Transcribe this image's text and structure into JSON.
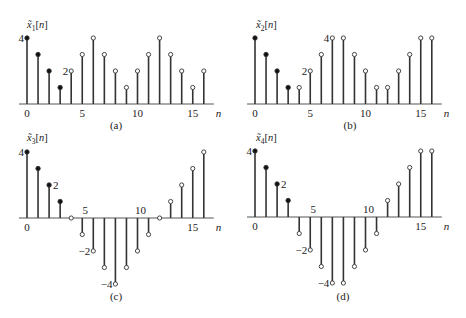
{
  "chart_data": [
    {
      "type": "stem",
      "panel_label": "(a)",
      "ylabel": "x̃1[n]",
      "ylabel_base": "x̃",
      "ylabel_sub": "1",
      "xlabel": "n",
      "x": [
        0,
        1,
        2,
        3,
        4,
        5,
        6,
        7,
        8,
        9,
        10,
        11,
        12,
        13,
        14,
        15,
        16
      ],
      "values": [
        4,
        3,
        2,
        1,
        2,
        3,
        4,
        3,
        2,
        1,
        2,
        3,
        4,
        3,
        2,
        1,
        2
      ],
      "filled": [
        true,
        true,
        true,
        true,
        false,
        false,
        false,
        false,
        false,
        false,
        false,
        false,
        false,
        false,
        false,
        false,
        false
      ],
      "x_ticks": [
        0,
        5,
        10,
        15
      ],
      "y_annotations": [
        {
          "value": 4,
          "label": "4",
          "at_n": 0
        },
        {
          "value": 2,
          "label": "2",
          "at_n": 4
        }
      ],
      "ylim": [
        0,
        4
      ]
    },
    {
      "type": "stem",
      "panel_label": "(b)",
      "ylabel": "x̃2[n]",
      "ylabel_base": "x̃",
      "ylabel_sub": "2",
      "xlabel": "n",
      "x": [
        0,
        1,
        2,
        3,
        4,
        5,
        6,
        7,
        8,
        9,
        10,
        11,
        12,
        13,
        14,
        15,
        16
      ],
      "values": [
        4,
        3,
        2,
        1,
        1,
        2,
        3,
        4,
        4,
        3,
        2,
        1,
        1,
        2,
        3,
        4,
        4
      ],
      "filled": [
        true,
        true,
        true,
        true,
        false,
        false,
        false,
        false,
        false,
        false,
        false,
        false,
        false,
        false,
        false,
        false,
        false
      ],
      "x_ticks": [
        0,
        5,
        10,
        15
      ],
      "y_annotations": [
        {
          "value": 4,
          "label": "4",
          "at_n": 7
        },
        {
          "value": 2,
          "label": "2",
          "at_n": 5
        }
      ],
      "ylim": [
        0,
        4
      ]
    },
    {
      "type": "stem",
      "panel_label": "(c)",
      "ylabel": "x̃3[n]",
      "ylabel_base": "x̃",
      "ylabel_sub": "3",
      "xlabel": "n",
      "x": [
        0,
        1,
        2,
        3,
        4,
        5,
        6,
        7,
        8,
        9,
        10,
        11,
        12,
        13,
        14,
        15,
        16
      ],
      "values": [
        4,
        3,
        2,
        1,
        0,
        -1,
        -2,
        -3,
        -4,
        -3,
        -2,
        -1,
        0,
        1,
        2,
        3,
        4
      ],
      "filled": [
        true,
        true,
        true,
        true,
        false,
        false,
        false,
        false,
        false,
        false,
        false,
        false,
        false,
        false,
        false,
        false,
        false
      ],
      "x_ticks": [
        0,
        5,
        10,
        15
      ],
      "y_annotations": [
        {
          "value": 4,
          "label": "4",
          "at_n": 0
        },
        {
          "value": 2,
          "label": "2",
          "at_n": 2,
          "side": "right"
        },
        {
          "value": -2,
          "label": "−2",
          "at_n": 6
        },
        {
          "value": -4,
          "label": "−4",
          "at_n": 8
        }
      ],
      "ylim": [
        -4,
        4
      ]
    },
    {
      "type": "stem",
      "panel_label": "(d)",
      "ylabel": "x̃4[n]",
      "ylabel_base": "x̃",
      "ylabel_sub": "4",
      "xlabel": "n",
      "x": [
        0,
        1,
        2,
        3,
        4,
        5,
        6,
        7,
        8,
        9,
        10,
        11,
        12,
        13,
        14,
        15,
        16
      ],
      "values": [
        4,
        3,
        2,
        1,
        -1,
        -2,
        -3,
        -4,
        -4,
        -3,
        -2,
        -1,
        1,
        2,
        3,
        4,
        4
      ],
      "filled": [
        true,
        true,
        true,
        true,
        false,
        false,
        false,
        false,
        false,
        false,
        false,
        false,
        false,
        false,
        false,
        false,
        false
      ],
      "x_ticks": [
        0,
        5,
        10,
        15
      ],
      "y_annotations": [
        {
          "value": 4,
          "label": "4",
          "at_n": 0
        },
        {
          "value": 2,
          "label": "2",
          "at_n": 2,
          "side": "right"
        },
        {
          "value": -2,
          "label": "−2",
          "at_n": 5
        },
        {
          "value": -4,
          "label": "−4",
          "at_n": 7
        }
      ],
      "ylim": [
        -4,
        4
      ]
    }
  ],
  "layout": {
    "panels": [
      {
        "x0": 27,
        "base": 104,
        "step": 11.05,
        "unit": 16.5,
        "label_x": 116,
        "label_y": 129,
        "ylabel_x": 27,
        "ylabel_y": 28
      },
      {
        "x0": 255,
        "base": 104,
        "step": 11.05,
        "unit": 16.5,
        "label_x": 350,
        "label_y": 129,
        "ylabel_x": 256,
        "ylabel_y": 28
      },
      {
        "x0": 27,
        "base": 218,
        "step": 11.05,
        "unit": 16.5,
        "label_x": 116,
        "label_y": 300,
        "ylabel_x": 27,
        "ylabel_y": 141
      },
      {
        "x0": 255,
        "base": 217,
        "step": 11.05,
        "unit": 16.5,
        "label_x": 343,
        "label_y": 300,
        "ylabel_x": 256,
        "ylabel_y": 141
      }
    ]
  }
}
